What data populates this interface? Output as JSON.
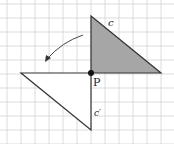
{
  "diagram": {
    "type": "rotation-on-grid",
    "grid": {
      "origin_x": 7,
      "origin_y": 4,
      "spacing": 14,
      "cols": 12,
      "rows": 10,
      "color": "#d0d0d0"
    },
    "pivot": {
      "label": "P",
      "x": 91,
      "y": 73
    },
    "original_triangle": {
      "label": "c",
      "fill": "#a6a6a6",
      "points": [
        [
          91,
          16
        ],
        [
          161,
          73
        ],
        [
          91,
          73
        ]
      ]
    },
    "image_triangle": {
      "label": "c′",
      "fill": "#ffffff",
      "points": [
        [
          21,
          73
        ],
        [
          91,
          73
        ],
        [
          91,
          130
        ]
      ]
    },
    "rotation_arrow": {
      "direction": "counterclockwise"
    },
    "stroke_color": "#333333"
  }
}
